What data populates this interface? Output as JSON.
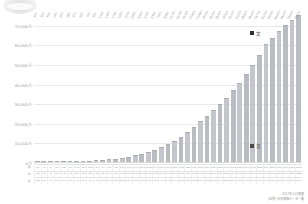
{
  "chart_data": {
    "type": "bar",
    "title": "",
    "xlabel": "",
    "ylabel": "",
    "ylim": [
      0,
      75000
    ],
    "grid": true,
    "legend_position": "inside-right",
    "ytick_labels": [
      "70,000人",
      "60,000人",
      "50,000人",
      "40,000人",
      "30,000人",
      "20,000人",
      "10,000人",
      "0人"
    ],
    "ytick_values": [
      70000,
      60000,
      50000,
      40000,
      30000,
      20000,
      10000,
      0
    ],
    "categories": [
      "0歳",
      "1歳",
      "2歳",
      "3歳",
      "4歳",
      "5歳",
      "6歳",
      "7歳",
      "8歳",
      "9歳",
      "10歳",
      "11歳",
      "12歳",
      "13歳",
      "14歳",
      "15歳",
      "16歳",
      "17歳",
      "18歳",
      "19歳",
      "20歳",
      "21歳",
      "22歳",
      "23歳",
      "24歳",
      "25歳",
      "26歳",
      "27歳",
      "28歳",
      "29歳",
      "30歳",
      "31歳",
      "32歳",
      "33歳",
      "34歳",
      "35歳",
      "36歳",
      "37歳",
      "38歳",
      "39歳",
      "40歳"
    ],
    "series": [
      {
        "name": "合計",
        "values": [
          120,
          150,
          190,
          240,
          300,
          380,
          470,
          590,
          740,
          920,
          1150,
          1430,
          1780,
          2210,
          2740,
          3380,
          4150,
          5080,
          6180,
          7470,
          8980,
          10740,
          12780,
          15140,
          17850,
          20960,
          23500,
          26300,
          29400,
          32800,
          36500,
          40500,
          44900,
          49600,
          54700,
          60100,
          63500,
          66800,
          69900,
          72600,
          75000
        ]
      }
    ],
    "data_labels": [
      "120",
      "150",
      "190",
      "240",
      "300",
      "380",
      "470",
      "590",
      "740",
      "920",
      "1,150",
      "1,430",
      "1,780",
      "2,210",
      "2,740",
      "3,380",
      "4,150",
      "5,080",
      "6,180",
      "7,470",
      "8,980",
      "10,740",
      "12,780",
      "15,140",
      "17,850",
      "20,960",
      "23,500",
      "26,300",
      "29,400",
      "32,800",
      "36,500",
      "40,500",
      "44,900",
      "49,600",
      "54,700",
      "60,100",
      "63,500",
      "66,800",
      "69,900",
      "72,600",
      "75,000"
    ],
    "legend": [
      {
        "label": "女",
        "color": "#2f2f2f"
      },
      {
        "label": "男",
        "color": "#4a4a4a"
      }
    ],
    "table": {
      "row_headers": [
        "男",
        "女",
        "計"
      ],
      "rows": [
        [
          "62",
          "78",
          "99",
          "124",
          "155",
          "196",
          "243",
          "305",
          "382",
          "475",
          "594",
          "739",
          "920",
          "1142",
          "1416",
          "1747",
          "2145",
          "2625",
          "3194",
          "3860",
          "4640",
          "5550",
          "6605",
          "7823",
          "9224",
          "10830",
          "12142",
          "13590",
          "15190",
          "16950",
          "18860",
          "20920",
          "23190",
          "25620",
          "28250",
          "31040",
          "32800",
          "34510",
          "36110",
          "37500",
          "38750"
        ],
        [
          "58",
          "72",
          "91",
          "116",
          "145",
          "184",
          "227",
          "285",
          "358",
          "445",
          "556",
          "691",
          "860",
          "1068",
          "1324",
          "1633",
          "2005",
          "2455",
          "2986",
          "3610",
          "4340",
          "5190",
          "6175",
          "7317",
          "8626",
          "10130",
          "11358",
          "12710",
          "14210",
          "15850",
          "17640",
          "19580",
          "21710",
          "23980",
          "26450",
          "29060",
          "30700",
          "32290",
          "33790",
          "35100",
          "36250"
        ],
        [
          "120",
          "150",
          "190",
          "240",
          "300",
          "380",
          "470",
          "590",
          "740",
          "920",
          "1150",
          "1430",
          "1780",
          "2210",
          "2740",
          "3380",
          "4150",
          "5080",
          "6180",
          "7470",
          "8980",
          "10740",
          "12780",
          "15140",
          "17850",
          "20960",
          "23500",
          "26300",
          "29400",
          "32800",
          "36500",
          "40500",
          "44900",
          "49600",
          "54700",
          "60100",
          "63500",
          "66800",
          "69900",
          "72600",
          "75000"
        ]
      ]
    }
  },
  "source": {
    "line1": "2017年人口調査",
    "line2": "(出所) 社会保障データ一覧"
  }
}
